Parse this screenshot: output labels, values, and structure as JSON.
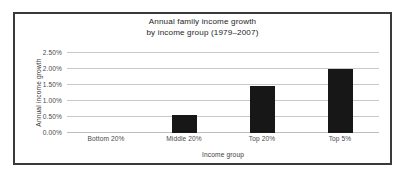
{
  "chart_data": {
    "type": "bar",
    "title_lines": [
      "Annual family income growth",
      "by income group (1979–2007)"
    ],
    "categories": [
      "Bottom 20%",
      "Middle 20%",
      "Top 20%",
      "Top 5%"
    ],
    "values": [
      0.0,
      0.55,
      1.46,
      1.97
    ],
    "value_labels": [
      "0.00%",
      "0.55%",
      "1.46%",
      "1.97%"
    ],
    "xlabel": "Income group",
    "ylabel": "Annual income growth",
    "ylim": [
      0.0,
      2.5
    ],
    "ytick_values": [
      0.0,
      0.5,
      1.0,
      1.5,
      2.0,
      2.5
    ],
    "ytick_labels": [
      "0.00%",
      "0.50%",
      "1.00%",
      "1.50%",
      "2.00%",
      "2.50%"
    ],
    "grid": true,
    "legend": false,
    "legend_position": "none",
    "bar_color": "#171717",
    "grid_color": "#c8c8c8",
    "frame_color": "#3a3a3a",
    "background_color": "#ffffff"
  }
}
